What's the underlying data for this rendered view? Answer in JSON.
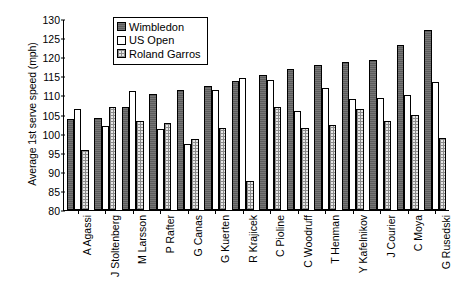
{
  "chart_data": {
    "type": "bar",
    "title": "",
    "xlabel": "",
    "ylabel": "Average 1st serve speed (mph)",
    "ylim": [
      80,
      130
    ],
    "ytick_step": 5,
    "yticks": [
      130,
      125,
      120,
      115,
      110,
      105,
      100,
      95,
      90,
      85,
      80
    ],
    "grid": false,
    "legend_position": "top-left-inside",
    "categories": [
      "A Agassi",
      "J Stoltenberg",
      "M Larsson",
      "P Rafter",
      "G Canas",
      "G Kuerten",
      "R Krajicek",
      "C Pioline",
      "C Woodruff",
      "T Henman",
      "Y Kafelnikov",
      "J Courier",
      "C Moya",
      "G Rusedski"
    ],
    "series": [
      {
        "name": "Wimbledon",
        "key": "wimbledon",
        "values": [
          104.0,
          104.2,
          107.2,
          110.4,
          111.6,
          112.7,
          114.0,
          115.4,
          117.2,
          118.2,
          119.0,
          119.6,
          123.5,
          127.5
        ]
      },
      {
        "name": "US Open",
        "key": "usopen",
        "values": [
          106.5,
          102.1,
          111.4,
          101.4,
          97.5,
          111.6,
          114.8,
          114.3,
          106.0,
          112.1,
          109.3,
          109.5,
          110.3,
          113.8
        ]
      },
      {
        "name": "Roland Garros",
        "key": "rolandgarros",
        "values": [
          95.8,
          107.0,
          103.4,
          102.8,
          98.6,
          101.6,
          87.6,
          107.2,
          101.6,
          102.4,
          106.6,
          103.3,
          105.1,
          98.9
        ]
      }
    ]
  }
}
